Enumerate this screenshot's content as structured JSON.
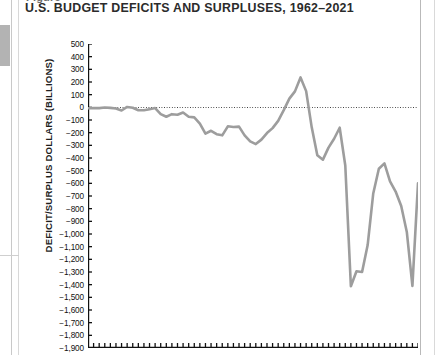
{
  "page": {
    "title_stub": "Figure",
    "left_tab_color": "#b3b3b3",
    "rule_color": "#b9b9b9"
  },
  "header": {
    "title": "U.S. BUDGET DEFICITS AND SURPLUSES, 1962–2021"
  },
  "chart_data": {
    "type": "line",
    "title": "U.S. BUDGET DEFICITS AND SURPLUSES, 1962–2021",
    "xlabel": "",
    "ylabel": "DEFICIT/SURPLUS DOLLARS (BILLIONS)",
    "ylim": [
      -1900,
      500
    ],
    "ytick_step": 100,
    "ytick_labels": [
      "500",
      "400",
      "300",
      "200",
      "100",
      "0",
      "−100",
      "−200",
      "−300",
      "−400",
      "−500",
      "−600",
      "−700",
      "−800",
      "−900",
      "−1,000",
      "−1,100",
      "−1,200",
      "−1,300",
      "−1,400",
      "−1,500",
      "−1,600",
      "−1,700",
      "−1,800",
      "−1,900"
    ],
    "ytick_values": [
      500,
      400,
      300,
      200,
      100,
      0,
      -100,
      -200,
      -300,
      -400,
      -500,
      -600,
      -700,
      -800,
      -900,
      -1000,
      -1100,
      -1200,
      -1300,
      -1400,
      -1500,
      -1600,
      -1700,
      -1800,
      -1900
    ],
    "xlim": [
      1962,
      2021
    ],
    "xtick_count": 60,
    "xtick_labels": [],
    "grid": false,
    "legend": false,
    "zero_reference_line": 0,
    "line_color": "#9d9d9d",
    "line_width": 2.6,
    "x": [
      1962,
      1963,
      1964,
      1965,
      1966,
      1967,
      1968,
      1969,
      1970,
      1971,
      1972,
      1973,
      1974,
      1975,
      1976,
      1977,
      1978,
      1979,
      1980,
      1981,
      1982,
      1983,
      1984,
      1985,
      1986,
      1987,
      1988,
      1989,
      1990,
      1991,
      1992,
      1993,
      1994,
      1995,
      1996,
      1997,
      1998,
      1999,
      2000,
      2001,
      2002,
      2003,
      2004,
      2005,
      2006,
      2007,
      2008,
      2009,
      2010,
      2011,
      2012,
      2013,
      2014,
      2015,
      2016,
      2017,
      2018,
      2019,
      2020,
      2021
    ],
    "values": [
      -7,
      -5,
      -6,
      -1,
      -4,
      -9,
      -25,
      3,
      -3,
      -23,
      -23,
      -15,
      -6,
      -53,
      -74,
      -54,
      -59,
      -41,
      -74,
      -79,
      -128,
      -208,
      -185,
      -212,
      -221,
      -150,
      -155,
      -152,
      -221,
      -269,
      -290,
      -255,
      -203,
      -164,
      -107,
      -22,
      69,
      126,
      236,
      128,
      -158,
      -378,
      -413,
      -318,
      -248,
      -161,
      -459,
      -1413,
      -1294,
      -1300,
      -1087,
      -680,
      -485,
      -442,
      -585,
      -665,
      -779,
      -984,
      -1410,
      -600
    ],
    "series": [
      {
        "name": "Deficit/Surplus",
        "values": [
          -7,
          -5,
          -6,
          -1,
          -4,
          -9,
          -25,
          3,
          -3,
          -23,
          -23,
          -15,
          -6,
          -53,
          -74,
          -54,
          -59,
          -41,
          -74,
          -79,
          -128,
          -208,
          -185,
          -212,
          -221,
          -150,
          -155,
          -152,
          -221,
          -269,
          -290,
          -255,
          -203,
          -164,
          -107,
          -22,
          69,
          126,
          236,
          128,
          -158,
          -378,
          -413,
          -318,
          -248,
          -161,
          -459,
          -1413,
          -1294,
          -1300,
          -1087,
          -680,
          -485,
          -442,
          -585,
          -665,
          -779,
          -984,
          -1410,
          -600
        ]
      }
    ]
  }
}
